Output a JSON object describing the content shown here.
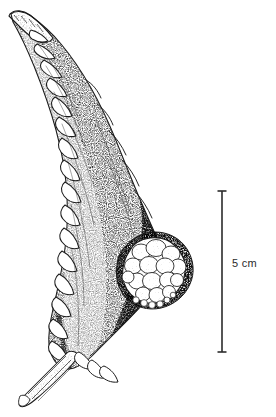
{
  "figure": {
    "type": "scientific-botanical-illustration",
    "medium": "stipple pen-and-ink line drawing",
    "background_color": "#ffffff",
    "ink_color": "#1a1a1a",
    "width_px": 276,
    "height_px": 417,
    "caption": "",
    "title": ""
  },
  "specimen": {
    "name": "spiny succulent stem segment with terminal white fruit cluster",
    "description": "A curved, tapering spiny stem (cladode) oriented with the pointed apex at upper left and a cut stem base at lower left. The body is rendered in dense stippling. The left margin bears a row of downward-hooked triangular spines. A rounded cluster of pale, lobed fruits or a cephalium protrudes from the lower right flank.",
    "orientation": "apex upper-left, base lower-left",
    "parts": [
      {
        "id": "apex",
        "label": "apex"
      },
      {
        "id": "blade",
        "label": "stem blade"
      },
      {
        "id": "left-spines",
        "label": "marginal spines"
      },
      {
        "id": "right-margin",
        "label": "right margin"
      },
      {
        "id": "fruit-cluster",
        "label": "fruit cluster"
      },
      {
        "id": "cut-stem",
        "label": "cut stem base"
      }
    ]
  },
  "scale_bar": {
    "label": "5 cm",
    "value": 5,
    "unit": "cm",
    "orientation": "vertical",
    "color": "#2b2b2b",
    "x_px": 222,
    "top_px": 191,
    "bottom_px": 352,
    "cap_width_px": 9,
    "line_width_px": 1.6,
    "label_x_px": 232,
    "label_y_px": 258
  }
}
